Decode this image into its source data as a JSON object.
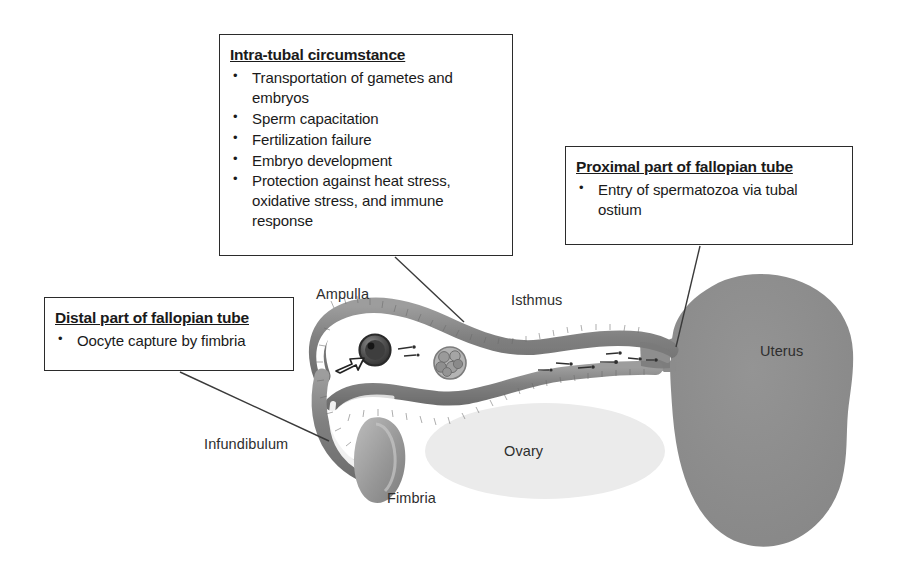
{
  "figure": {
    "kind": "anatomical-diagram",
    "background_color": "#ffffff"
  },
  "callouts": [
    {
      "id": "intratubal",
      "title": "Intra-tubal circumstance",
      "bullet_glyph": "•",
      "items": [
        "Transportation of gametes and embryos",
        "Sperm capacitation",
        "Fertilization failure",
        "Embryo development",
        "Protection against heat stress, oxidative stress, and immune response"
      ]
    },
    {
      "id": "proximal",
      "title": "Proximal part of fallopian tube",
      "bullet_glyph": "•",
      "items": [
        "Entry of spermatozoa via tubal ostium"
      ]
    },
    {
      "id": "distal",
      "title": "Distal part of fallopian tube",
      "bullet_glyph": "•",
      "items": [
        "Oocyte capture by fimbria"
      ]
    }
  ],
  "anatomy_labels": {
    "ampulla": "Ampulla",
    "isthmus": "Isthmus",
    "infundibulum": "Infundibulum",
    "fimbria": "Fimbria",
    "ovary": "Ovary",
    "uterus": "Uterus"
  },
  "colors": {
    "tube_wall": "#8f8f8f",
    "tube_wall_dark": "#6f6f6f",
    "tube_lumen": "#ffffff",
    "uterus": "#8c8c8c",
    "ovary": "#ebebeb",
    "fimbria": "#9a9a9a",
    "oocyte": "#4a4a4a",
    "embryo": "#a0a0a0",
    "leader_line": "#3a3a3a",
    "box_border": "#2b2b2b",
    "text": "#1a1a1a"
  },
  "structures": [
    "fallopian-tube",
    "infundibulum-hook",
    "fimbria",
    "ovary",
    "uterus",
    "oocyte",
    "embryo",
    "spermatozoa",
    "capture-arrow"
  ],
  "leader_lines": [
    {
      "from": "intratubal-callout",
      "to": "ampulla-region"
    },
    {
      "from": "proximal-callout",
      "to": "tubal-ostium"
    },
    {
      "from": "distal-callout",
      "to": "infundibulum"
    }
  ]
}
